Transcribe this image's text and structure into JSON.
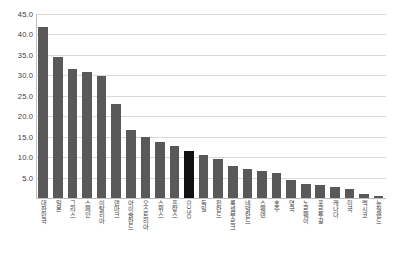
{
  "chart_data": {
    "type": "bar",
    "title": "",
    "subtitle": "",
    "xlabel": "",
    "ylabel": "",
    "ylim": [
      0,
      45
    ],
    "ytick_step": 5,
    "grid": true,
    "legend": "none",
    "highlight_color": "#111111",
    "bar_color": "#595959",
    "ytick_labels": [
      "45.0",
      "40.0",
      "35.0",
      "30.0",
      "25.0",
      "20.0",
      "15.0",
      "10.0",
      "5.0",
      "0.0"
    ],
    "ytick_values": [
      45,
      40,
      35,
      30,
      25,
      20,
      15,
      10,
      5,
      0
    ],
    "categories": [
      "대한민국",
      "일본",
      "그리스",
      "스페인",
      "이탈리아",
      "덴마크",
      "아이슬란드",
      "오스트리아",
      "스위스",
      "프랑스",
      "OECD",
      "독일",
      "핀란드",
      "룩셈부르크",
      "네덜란드",
      "스웨덴",
      "호주",
      "영국",
      "노르웨이",
      "포르투갈",
      "캐나다",
      "미국",
      "멕시코",
      "뉴질랜드"
    ],
    "values": [
      41.8,
      34.4,
      31.5,
      30.7,
      29.9,
      23.0,
      16.7,
      14.9,
      13.6,
      12.7,
      11.5,
      10.5,
      9.5,
      7.9,
      7.1,
      6.6,
      6.0,
      4.3,
      3.5,
      3.1,
      2.8,
      2.2,
      1.0,
      0.4
    ],
    "highlight_index": 10,
    "highlight_label": "OECD"
  }
}
